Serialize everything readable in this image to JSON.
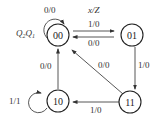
{
  "diagram": {
    "type": "state-transition",
    "state_var_label": "Q2Q1",
    "io_label": "x/Z",
    "states": [
      {
        "id": "00",
        "label": "00"
      },
      {
        "id": "01",
        "label": "01"
      },
      {
        "id": "10",
        "label": "10"
      },
      {
        "id": "11",
        "label": "11"
      }
    ],
    "transitions": [
      {
        "from": "00",
        "to": "00",
        "label": "0/0"
      },
      {
        "from": "00",
        "to": "01",
        "label": "1/0"
      },
      {
        "from": "01",
        "to": "00",
        "label": "0/0"
      },
      {
        "from": "01",
        "to": "11",
        "label": "1/0"
      },
      {
        "from": "11",
        "to": "00",
        "label": "0/0"
      },
      {
        "from": "11",
        "to": "10",
        "label": "1/0"
      },
      {
        "from": "10",
        "to": "00",
        "label": "0/0"
      },
      {
        "from": "10",
        "to": "10",
        "label": "1/1"
      }
    ]
  }
}
